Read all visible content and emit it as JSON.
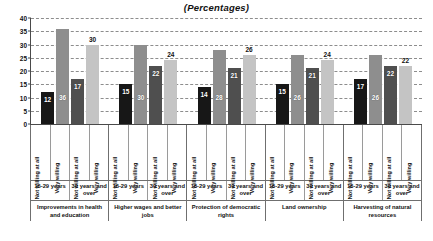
{
  "chart_data": {
    "type": "bar",
    "title": "(Percentages)",
    "xlabel": "",
    "ylabel": "",
    "ylim": [
      0,
      40
    ],
    "ytick_step": 5,
    "yticks": [
      0,
      5,
      10,
      15,
      20,
      25,
      30,
      35,
      40
    ],
    "grid": true,
    "legend": "none",
    "sub_categories": [
      "Not willing at all",
      "Very willing"
    ],
    "age_groups": [
      "16-29 years",
      "30 years and over"
    ],
    "categories": [
      "Improvements in health and education",
      "Higher wages and better jobs",
      "Protection of democratic rights",
      "Land ownership",
      "Harvesting of natural resources"
    ],
    "series": [
      {
        "name": "16-29 years / Not willing at all",
        "values": [
          12,
          15,
          14,
          15,
          17
        ],
        "color": "#171717"
      },
      {
        "name": "16-29 years / Very willing",
        "values": [
          36,
          30,
          28,
          26,
          26
        ],
        "color": "#8e8e8e"
      },
      {
        "name": "30 years and over / Not willing at all",
        "values": [
          17,
          22,
          21,
          21,
          22
        ],
        "color": "#4f4f4f"
      },
      {
        "name": "30 years and over / Very willing",
        "values": [
          30,
          24,
          26,
          24,
          22
        ],
        "color": "#c4c4c4"
      }
    ],
    "groups": [
      {
        "category": "Improvements in health and education",
        "bars": [
          {
            "age": "16-29 years",
            "willingness": "Not willing at all",
            "value": 12
          },
          {
            "age": "16-29 years",
            "willingness": "Very willing",
            "value": 36
          },
          {
            "age": "30 years and over",
            "willingness": "Not willing at all",
            "value": 17
          },
          {
            "age": "30 years and over",
            "willingness": "Very willing",
            "value": 30
          }
        ]
      },
      {
        "category": "Higher wages and better jobs",
        "bars": [
          {
            "age": "16-29 years",
            "willingness": "Not willing at all",
            "value": 15
          },
          {
            "age": "16-29 years",
            "willingness": "Very willing",
            "value": 30
          },
          {
            "age": "30 years and over",
            "willingness": "Not willing at all",
            "value": 22
          },
          {
            "age": "30 years and over",
            "willingness": "Very willing",
            "value": 24
          }
        ]
      },
      {
        "category": "Protection of democratic rights",
        "bars": [
          {
            "age": "16-29 years",
            "willingness": "Not willing at all",
            "value": 14
          },
          {
            "age": "16-29 years",
            "willingness": "Very willing",
            "value": 28
          },
          {
            "age": "30 years and over",
            "willingness": "Not willing at all",
            "value": 21
          },
          {
            "age": "30 years and over",
            "willingness": "Very willing",
            "value": 26
          }
        ]
      },
      {
        "category": "Land ownership",
        "bars": [
          {
            "age": "16-29 years",
            "willingness": "Not willing at all",
            "value": 15
          },
          {
            "age": "16-29 years",
            "willingness": "Very willing",
            "value": 26
          },
          {
            "age": "30 years and over",
            "willingness": "Not willing at all",
            "value": 21
          },
          {
            "age": "30 years and over",
            "willingness": "Very willing",
            "value": 24
          }
        ]
      },
      {
        "category": "Harvesting of natural resources",
        "bars": [
          {
            "age": "16-29 years",
            "willingness": "Not willing at all",
            "value": 17
          },
          {
            "age": "16-29 years",
            "willingness": "Very willing",
            "value": 26
          },
          {
            "age": "30 years and over",
            "willingness": "Not willing at all",
            "value": 22
          },
          {
            "age": "30 years and over",
            "willingness": "Very willing",
            "value": 22
          }
        ]
      }
    ],
    "colors": {
      "bar_not_willing_young": "#171717",
      "bar_very_willing_young": "#8e8e8e",
      "bar_not_willing_old": "#4f4f4f",
      "bar_very_willing_old": "#c4c4c4",
      "axis": "#4a4a4a",
      "grid": "#8d8d8d",
      "background": "#ffffff"
    }
  }
}
